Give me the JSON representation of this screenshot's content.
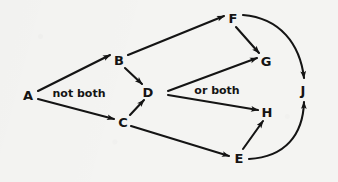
{
  "figure": {
    "type": "directed-graph-diagram",
    "width": 338,
    "height": 182,
    "background_color": "#f4f4f2",
    "ink_color": "#141414"
  },
  "nodes": [
    {
      "id": "A",
      "label": "A",
      "x": 28,
      "y": 95
    },
    {
      "id": "B",
      "label": "B",
      "x": 119,
      "y": 60
    },
    {
      "id": "C",
      "label": "C",
      "x": 123,
      "y": 122
    },
    {
      "id": "D",
      "label": "D",
      "x": 148,
      "y": 92
    },
    {
      "id": "E",
      "label": "E",
      "x": 239,
      "y": 158
    },
    {
      "id": "F",
      "label": "F",
      "x": 233,
      "y": 18
    },
    {
      "id": "G",
      "label": "G",
      "x": 266,
      "y": 61
    },
    {
      "id": "H",
      "label": "H",
      "x": 267,
      "y": 112
    },
    {
      "id": "J",
      "label": "J",
      "x": 303,
      "y": 90
    }
  ],
  "edge_labels": [
    {
      "id": "not-both",
      "text": "not both",
      "x": 79,
      "y": 93
    },
    {
      "id": "or-both",
      "text": "or both",
      "x": 217,
      "y": 90
    }
  ],
  "edges": [
    {
      "id": "A-B",
      "from": "A",
      "to": "B",
      "shape": "straight",
      "arrow": true
    },
    {
      "id": "A-C",
      "from": "A",
      "to": "C",
      "shape": "straight",
      "arrow": true
    },
    {
      "id": "B-D",
      "from": "B",
      "to": "D",
      "shape": "straight",
      "arrow": true
    },
    {
      "id": "C-D",
      "from": "C",
      "to": "D",
      "shape": "straight",
      "arrow": true
    },
    {
      "id": "B-F",
      "from": "B",
      "to": "F",
      "shape": "straight",
      "arrow": true
    },
    {
      "id": "F-G",
      "from": "F",
      "to": "G",
      "shape": "straight",
      "arrow": true
    },
    {
      "id": "F-J",
      "from": "F",
      "to": "J",
      "shape": "curved",
      "arrow": true
    },
    {
      "id": "fork-G",
      "from": "fork",
      "to": "G",
      "shape": "straight",
      "arrow": true
    },
    {
      "id": "fork-H",
      "from": "fork",
      "to": "H",
      "shape": "straight",
      "arrow": true
    },
    {
      "id": "C-E",
      "from": "C",
      "to": "E",
      "shape": "straight",
      "arrow": true
    },
    {
      "id": "E-H",
      "from": "E",
      "to": "H",
      "shape": "straight",
      "arrow": true
    },
    {
      "id": "E-J",
      "from": "E",
      "to": "J",
      "shape": "curved",
      "arrow": true
    }
  ]
}
